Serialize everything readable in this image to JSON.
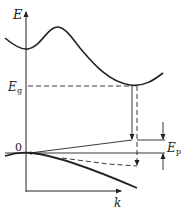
{
  "diagram": {
    "axes": {
      "y_label": "E",
      "x_label": "k",
      "origin_label": "0"
    },
    "labels": {
      "gap_main": "E",
      "gap_sub": "g",
      "phonon_main": "E",
      "phonon_sub": "p"
    },
    "elements": [
      "conduction-band-curve",
      "valence-band-curve",
      "band-gap-dashed-level",
      "indirect-transition-arrow",
      "phonon-assisted-dashed-arrow",
      "phonon-energy-marker"
    ],
    "colors": {
      "line": "#222222",
      "background": "#ffffff"
    }
  }
}
